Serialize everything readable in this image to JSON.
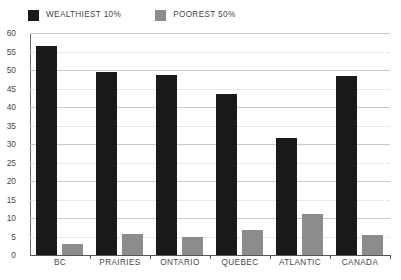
{
  "chart_data": {
    "type": "bar",
    "title": "",
    "xlabel": "",
    "ylabel": "",
    "ylim": [
      0,
      60
    ],
    "ytick_step": 5,
    "grid": true,
    "legend_position": "top-left",
    "categories": [
      "BC",
      "PRAIRIES",
      "ONTARIO",
      "QUEBEC",
      "ATLANTIC",
      "CANADA"
    ],
    "ytick_labels": [
      "0",
      "5",
      "10",
      "15",
      "20",
      "25",
      "30",
      "35",
      "40",
      "45",
      "50",
      "55",
      "60"
    ],
    "series": [
      {
        "name": "WEALTHIEST 10%",
        "color": "#1a1a1a",
        "values": [
          56.5,
          49.5,
          48.7,
          43.5,
          31.5,
          48.5
        ]
      },
      {
        "name": "POOREST 50%",
        "color": "#8c8c8c",
        "values": [
          3.0,
          5.7,
          4.9,
          6.8,
          11.0,
          5.3
        ]
      }
    ]
  },
  "colors": {
    "wealthiest": "#1a1a1a",
    "poorest": "#8c8c8c",
    "gridline": "#c9c9c9",
    "axis": "#555555",
    "text": "#474747",
    "background": "#ffffff"
  }
}
